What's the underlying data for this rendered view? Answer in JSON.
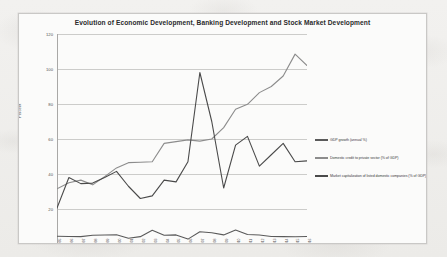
{
  "chart_data": {
    "type": "line",
    "title": "Evolution of Economic Development, Banking Development and Stock Market Development",
    "xlabel": "",
    "ylabel": "Percent",
    "ylim": [
      0,
      120
    ],
    "yticks": [
      0,
      20,
      40,
      60,
      80,
      100,
      120
    ],
    "grid": true,
    "legend_position": "right",
    "categories": [
      "1995",
      "1996",
      "1997",
      "1998",
      "1999",
      "2000",
      "2001",
      "2002",
      "2003",
      "2004",
      "2005",
      "2006",
      "2007",
      "2008",
      "2009",
      "2010",
      "2011",
      "2012",
      "2013",
      "2014",
      "2015",
      "2016"
    ],
    "series": [
      {
        "name": "GDP growth (annual %)",
        "color": "#5a5a5a",
        "values": [
          4.4,
          4.3,
          4.2,
          5.0,
          5.1,
          5.3,
          3.3,
          4.2,
          7.8,
          5.0,
          5.2,
          2.8,
          7.0,
          6.4,
          5.2,
          8.0,
          5.4,
          5.1,
          4.3,
          4.2,
          4.1,
          4.3
        ]
      },
      {
        "name": "Domestic credit to private sector (% of GDP)",
        "color": "#8c8c8c",
        "values": [
          31.5,
          35.0,
          36.5,
          33.8,
          38.5,
          43.5,
          46.5,
          46.7,
          47.0,
          57.5,
          58.5,
          59.5,
          58.8,
          60.0,
          66.5,
          77.0,
          79.8,
          86.5,
          90.0,
          96.0,
          108.5,
          102.0
        ]
      },
      {
        "name": "Market capitalization of listed domestic companies (% of GDP)",
        "color": "#4a4a4a",
        "values": [
          20.5,
          38.0,
          34.5,
          34.8,
          38.0,
          41.5,
          33.0,
          26.0,
          27.5,
          36.5,
          35.5,
          47.0,
          98.0,
          70.0,
          32.0,
          56.5,
          61.5,
          44.5,
          51.0,
          57.5,
          47.0,
          47.5
        ]
      }
    ]
  },
  "legend": {
    "entries": [
      "GDP growth (annual %)",
      "Domestic credit to private sector (% of GDP)",
      "Market capitalization of listed domestic companies (% of GDP)"
    ]
  }
}
